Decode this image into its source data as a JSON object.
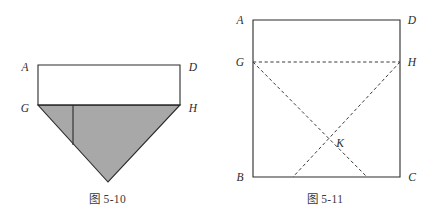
{
  "page": {
    "background_color": "#ffffff",
    "width": 435,
    "height": 218
  },
  "figures": [
    {
      "id": "figure-5-10",
      "caption": "图 5-10",
      "description": "Rectangle ADHG above a shaded downward-pointing triangle GH-apex, with an interior vertical segment",
      "shading_color": "#a8a8a8",
      "stroke_color": "#2b2b2b",
      "labels": {
        "a": "A",
        "d": "D",
        "g": "G",
        "h": "H"
      }
    },
    {
      "id": "figure-5-11",
      "caption": "图 5-11",
      "description": "Square ABCD with dashed segment GH and dashed diagonals GC and HB crossing at K",
      "stroke_color": "#2b2b2b",
      "dash_color": "#3a3a3a",
      "labels": {
        "a": "A",
        "d": "D",
        "g": "G",
        "h": "H",
        "b": "B",
        "c": "C",
        "k": "K"
      }
    }
  ]
}
